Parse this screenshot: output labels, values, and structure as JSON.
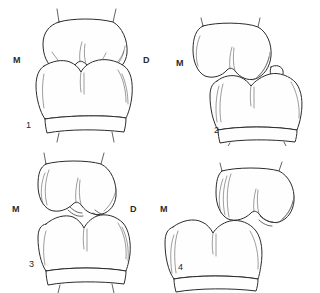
{
  "figure": {
    "background_color": "#ffffff",
    "ink_color": "#2b2b2b",
    "panel_count": 4,
    "layout": "2x2 grid"
  },
  "panels": [
    {
      "number": "1",
      "mesial_label": "M",
      "distal_label": "D",
      "description": "Paired upper and lower tooth crowns in full occlusion, viewed buccally; cusps interdigitate evenly with no displacement."
    },
    {
      "number": "2",
      "mesial_label": "M",
      "distal_label": "",
      "description": "Upper and lower crowns offset distally; the distal cusp of the lower crown rides up over the upper crown margin."
    },
    {
      "number": "3",
      "mesial_label": "M",
      "distal_label": "D",
      "description": "Crowns separated at the occlusal interface showing an open notch between the opposing cusps at midline and distal contact."
    },
    {
      "number": "4",
      "mesial_label": "M",
      "distal_label": "",
      "description": "Markedly displaced crowns with the lower crown shifted mesially and downward relative to the upper crown."
    }
  ]
}
